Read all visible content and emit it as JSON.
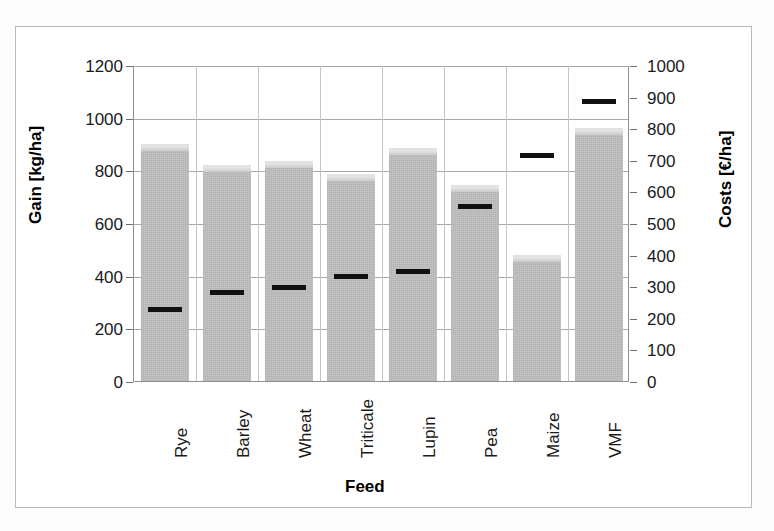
{
  "chart_data": {
    "type": "bar",
    "title": "",
    "xlabel": "Feed",
    "ylabel": "Gain [kg/ha]",
    "y2label": "Costs [€/ha]",
    "categories": [
      "Rye",
      "Barley",
      "Wheat",
      "Triticale",
      "Lupin",
      "Pea",
      "Maize",
      "VMF"
    ],
    "series": [
      {
        "name": "Gain [kg/ha]",
        "type": "bar",
        "axis": "left",
        "unit": "kg/ha",
        "values": [
          900,
          820,
          835,
          785,
          885,
          745,
          480,
          960
        ]
      },
      {
        "name": "Costs [€/ha]",
        "type": "marker",
        "axis": "right",
        "unit": "€/ha",
        "values": [
          230,
          282,
          298,
          335,
          350,
          555,
          718,
          888
        ]
      }
    ],
    "ylim": [
      0,
      1200
    ],
    "y2lim": [
      0,
      1000
    ],
    "yticks": [
      0,
      200,
      400,
      600,
      800,
      1000,
      1200
    ],
    "y2ticks": [
      0,
      100,
      200,
      300,
      400,
      500,
      600,
      700,
      800,
      900,
      1000
    ],
    "grid": true,
    "legend": "none",
    "bar_color": "#c0c0c0",
    "marker_color": "#111111",
    "gridline_color": "#a8a8a8",
    "axis_color": "#8f8f8f"
  }
}
